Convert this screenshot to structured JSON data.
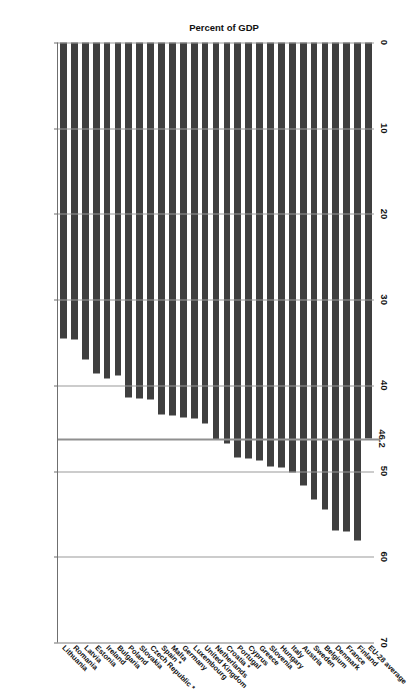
{
  "chart_data": {
    "type": "bar",
    "orientation": "horizontal",
    "title": "",
    "xlabel": "Percent of GDP",
    "ylabel": "",
    "xlim": [
      0,
      70
    ],
    "xticks": [
      0,
      10,
      20,
      30,
      40,
      50,
      60,
      70
    ],
    "grid": true,
    "legend": null,
    "categories": [
      "EU-28 average",
      "Finland",
      "France",
      "Denmark",
      "Belgium",
      "Sweden",
      "Austria",
      "Italy",
      "Hungary",
      "Slovenia",
      "Greece",
      "Cyprus",
      "Portugal",
      "Croatia *",
      "Netherlands",
      "United Kingdom",
      "Luxembourg",
      "Germany",
      "Malta",
      "Spain *",
      "Czech Republic *",
      "Slovakia",
      "Poland",
      "Bulgaria",
      "Ireland",
      "Estonia",
      "Latvia",
      "Romania",
      "Lithuania"
    ],
    "values": [
      46.2,
      58.1,
      57.1,
      56.9,
      54.5,
      53.3,
      51.7,
      50.2,
      49.6,
      49.5,
      48.8,
      48.5,
      48.4,
      46.8,
      46.3,
      44.4,
      43.9,
      43.8,
      43.5,
      43.4,
      41.7,
      41.5,
      41.4,
      38.9,
      39.2,
      38.6,
      37.0,
      34.7,
      34.5
    ],
    "annotations": [
      {
        "label": "46.2",
        "value": 46.2,
        "type": "reference-line"
      }
    ],
    "bar_color": "#3f3f3f",
    "reference_line_color": "#8f8f8f",
    "footnote_marker": "*"
  },
  "axis": {
    "title": "Percent of GDP",
    "tick_labels": [
      "70",
      "60",
      "50",
      "40",
      "30",
      "20",
      "10",
      "0"
    ]
  }
}
